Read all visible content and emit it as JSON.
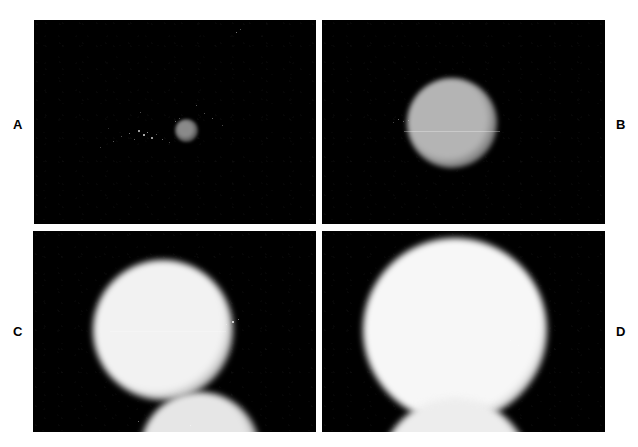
{
  "figure": {
    "width": 638,
    "height": 447,
    "background_color": "#ffffff",
    "panel_background_color": "#000000",
    "label_color": "#000000",
    "type": "multi-panel-micrograph-series"
  },
  "panels": [
    {
      "id": "A",
      "label": "A",
      "label_position": "left",
      "label_x": 13,
      "label_y": 118,
      "frame": {
        "x": 34,
        "y": 20,
        "width": 282,
        "height": 204
      },
      "objects": [
        {
          "name": "primary-sphere",
          "cx": 186,
          "cy": 130,
          "r": 11.5,
          "core_color": "#8a8a8a",
          "edge_color": "#0a0a0a",
          "core_stop": 38,
          "edge_stop": 100,
          "blur": 1.6
        }
      ],
      "specks": [
        {
          "x": 113,
          "y": 141,
          "size": 1.2,
          "opacity": 0.45
        },
        {
          "x": 121,
          "y": 136,
          "size": 1.0,
          "opacity": 0.4
        },
        {
          "x": 129,
          "y": 133,
          "size": 1.4,
          "opacity": 0.6
        },
        {
          "x": 134,
          "y": 139,
          "size": 1.2,
          "opacity": 0.5
        },
        {
          "x": 138,
          "y": 130,
          "size": 1.6,
          "opacity": 0.75
        },
        {
          "x": 143,
          "y": 134,
          "size": 1.8,
          "opacity": 0.85
        },
        {
          "x": 147,
          "y": 132,
          "size": 1.3,
          "opacity": 0.65
        },
        {
          "x": 151,
          "y": 137,
          "size": 1.5,
          "opacity": 0.7
        },
        {
          "x": 156,
          "y": 134,
          "size": 1.1,
          "opacity": 0.45
        },
        {
          "x": 162,
          "y": 139,
          "size": 1.3,
          "opacity": 0.55
        },
        {
          "x": 169,
          "y": 142,
          "size": 1.0,
          "opacity": 0.35
        },
        {
          "x": 140,
          "y": 112,
          "size": 1.1,
          "opacity": 0.4
        },
        {
          "x": 175,
          "y": 121,
          "size": 1.2,
          "opacity": 0.55
        },
        {
          "x": 179,
          "y": 118,
          "size": 1.0,
          "opacity": 0.4
        },
        {
          "x": 196,
          "y": 105,
          "size": 1.1,
          "opacity": 0.45
        },
        {
          "x": 204,
          "y": 113,
          "size": 1.0,
          "opacity": 0.4
        },
        {
          "x": 212,
          "y": 118,
          "size": 1.2,
          "opacity": 0.5
        },
        {
          "x": 222,
          "y": 125,
          "size": 1.0,
          "opacity": 0.38
        },
        {
          "x": 236,
          "y": 32,
          "size": 1.3,
          "opacity": 0.6
        },
        {
          "x": 240,
          "y": 29,
          "size": 1.0,
          "opacity": 0.45
        },
        {
          "x": 100,
          "y": 147,
          "size": 1.0,
          "opacity": 0.35
        },
        {
          "x": 108,
          "y": 128,
          "size": 0.9,
          "opacity": 0.3
        }
      ],
      "hairlines": []
    },
    {
      "id": "B",
      "label": "B",
      "label_position": "right",
      "label_x": 616,
      "label_y": 118,
      "frame": {
        "x": 322,
        "y": 20,
        "width": 283,
        "height": 204
      },
      "objects": [
        {
          "name": "primary-sphere",
          "cx": 452,
          "cy": 123,
          "r": 45,
          "core_color": "#b4b4b4",
          "edge_color": "#090909",
          "core_stop": 55,
          "edge_stop": 100,
          "blur": 2.6
        }
      ],
      "specks": [
        {
          "x": 398,
          "y": 119,
          "size": 1.4,
          "opacity": 0.55
        },
        {
          "x": 403,
          "y": 121,
          "size": 1.2,
          "opacity": 0.45
        },
        {
          "x": 408,
          "y": 120,
          "size": 1.0,
          "opacity": 0.4
        },
        {
          "x": 393,
          "y": 122,
          "size": 1.0,
          "opacity": 0.35
        }
      ],
      "hairlines": [
        {
          "x": 404,
          "y": 131,
          "width": 96,
          "opacity": 0.3
        }
      ]
    },
    {
      "id": "C",
      "label": "C",
      "label_position": "left",
      "label_x": 13,
      "label_y": 325,
      "frame": {
        "x": 33,
        "y": 231,
        "width": 283,
        "height": 201
      },
      "objects": [
        {
          "name": "primary-sphere",
          "cx": 163,
          "cy": 330,
          "r": 70,
          "core_color": "#f2f2f2",
          "edge_color": "#0a0a0a",
          "core_stop": 62,
          "edge_stop": 100,
          "blur": 3.0
        },
        {
          "name": "secondary-sphere",
          "cx": 200,
          "cy": 452,
          "r": 60,
          "core_color": "#e6e6e6",
          "edge_color": "#0a0a0a",
          "core_stop": 58,
          "edge_stop": 100,
          "blur": 3.2
        }
      ],
      "specks": [
        {
          "x": 232,
          "y": 321,
          "size": 1.6,
          "opacity": 0.85
        },
        {
          "x": 238,
          "y": 319,
          "size": 1.2,
          "opacity": 0.6
        },
        {
          "x": 226,
          "y": 324,
          "size": 1.1,
          "opacity": 0.5
        },
        {
          "x": 190,
          "y": 425,
          "size": 1.4,
          "opacity": 0.7
        },
        {
          "x": 138,
          "y": 421,
          "size": 1.2,
          "opacity": 0.55
        }
      ],
      "hairlines": [
        {
          "x": 110,
          "y": 331,
          "width": 116,
          "opacity": 0.22
        }
      ]
    },
    {
      "id": "D",
      "label": "D",
      "label_position": "right",
      "label_x": 616,
      "label_y": 325,
      "frame": {
        "x": 322,
        "y": 231,
        "width": 283,
        "height": 201
      },
      "objects": [
        {
          "name": "primary-sphere",
          "cx": 455,
          "cy": 330,
          "r": 92,
          "core_color": "#f7f7f7",
          "edge_color": "#0a0a0a",
          "core_stop": 66,
          "edge_stop": 100,
          "blur": 3.4
        },
        {
          "name": "secondary-sphere",
          "cx": 455,
          "cy": 474,
          "r": 76,
          "core_color": "#ededed",
          "edge_color": "#0a0a0a",
          "core_stop": 60,
          "edge_stop": 100,
          "blur": 3.4
        }
      ],
      "specks": [
        {
          "x": 510,
          "y": 340,
          "size": 1.3,
          "opacity": 0.45
        },
        {
          "x": 518,
          "y": 345,
          "size": 1.1,
          "opacity": 0.35
        }
      ],
      "hairlines": []
    }
  ],
  "chart_data": {
    "type": "image-series",
    "title": "",
    "panel_labels": [
      "A",
      "B",
      "C",
      "D"
    ],
    "measured_radii_px": [
      11.5,
      45,
      70,
      92
    ],
    "relative_size_index": [
      1.0,
      3.9,
      6.1,
      8.0
    ],
    "grid_rows": 2,
    "grid_cols": 2,
    "note": "Sphere radius increases monotonically from panel A through panel D"
  }
}
